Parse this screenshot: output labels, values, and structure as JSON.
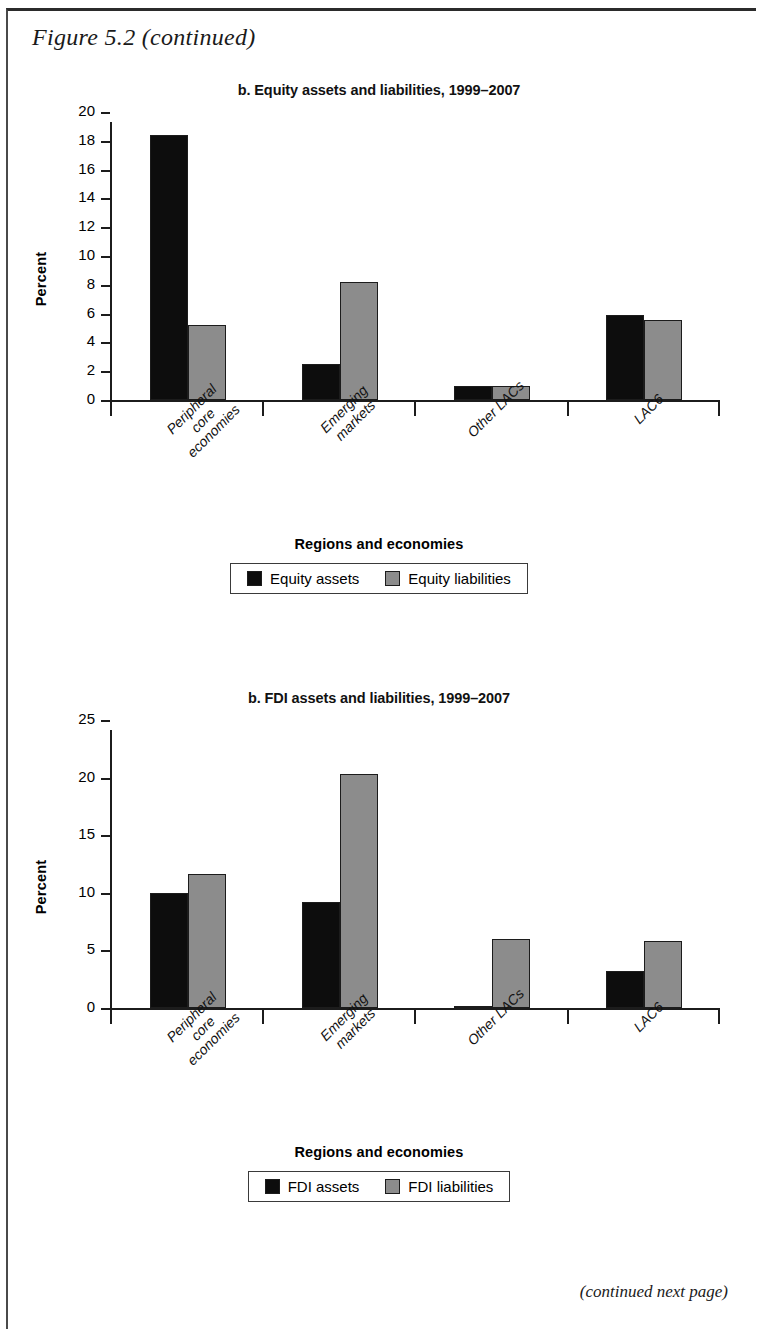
{
  "figure": {
    "title": "Figure 5.2 (continued)",
    "footer": "(continued next page)"
  },
  "panels": [
    {
      "id": "equity",
      "title": "b. Equity assets and liabilities, 1999–2007",
      "axis_title": "Regions and economies",
      "ylabel": "Percent",
      "legend": [
        {
          "label": "Equity assets",
          "color": "#0d0d0d"
        },
        {
          "label": "Equity liabilities",
          "color": "#8c8c8c"
        }
      ],
      "yticks": [
        "0",
        "2",
        "4",
        "6",
        "8",
        "10",
        "12",
        "14",
        "16",
        "18",
        "20"
      ],
      "categories": [
        "Peripheral core\neconomies",
        "Emerging\nmarkets",
        "Other LACs",
        "LAC6"
      ]
    },
    {
      "id": "fdi",
      "title": "b. FDI assets and liabilities, 1999–2007",
      "axis_title": "Regions and economies",
      "ylabel": "Percent",
      "legend": [
        {
          "label": "FDI assets",
          "color": "#0d0d0d"
        },
        {
          "label": "FDI liabilities",
          "color": "#8c8c8c"
        }
      ],
      "yticks": [
        "0",
        "5",
        "10",
        "15",
        "20",
        "25"
      ],
      "categories": [
        "Peripheral core\neconomies",
        "Emerging\nmarkets",
        "Other LACs",
        "LAC6"
      ]
    }
  ],
  "chart_data": [
    {
      "type": "bar",
      "title": "b. Equity assets and liabilities, 1999–2007",
      "xlabel": "Regions and economies",
      "ylabel": "Percent",
      "ylim": [
        0,
        20
      ],
      "ytick_step": 2,
      "grid": false,
      "legend_position": "bottom",
      "categories": [
        "Peripheral core economies",
        "Emerging markets",
        "Other LACs",
        "LAC6"
      ],
      "series": [
        {
          "name": "Equity assets",
          "color": "#0d0d0d",
          "values": [
            18.4,
            2.5,
            1.0,
            5.9
          ]
        },
        {
          "name": "Equity liabilities",
          "color": "#8c8c8c",
          "values": [
            5.2,
            8.2,
            0.95,
            5.55
          ]
        }
      ]
    },
    {
      "type": "bar",
      "title": "b. FDI assets and liabilities, 1999–2007",
      "xlabel": "Regions and economies",
      "ylabel": "Percent",
      "ylim": [
        0,
        25
      ],
      "ytick_step": 5,
      "grid": false,
      "legend_position": "bottom",
      "categories": [
        "Peripheral core economies",
        "Emerging markets",
        "Other LACs",
        "LAC6"
      ],
      "series": [
        {
          "name": "FDI assets",
          "color": "#0d0d0d",
          "values": [
            10.0,
            9.2,
            0.2,
            3.2
          ]
        },
        {
          "name": "FDI liabilities",
          "color": "#8c8c8c",
          "values": [
            11.6,
            20.3,
            5.95,
            5.85
          ]
        }
      ]
    }
  ]
}
